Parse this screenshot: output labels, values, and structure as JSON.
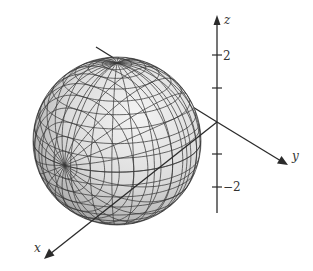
{
  "figure": {
    "axes": {
      "x": {
        "label": "x"
      },
      "y": {
        "label": "y"
      },
      "z": {
        "label": "z"
      }
    },
    "z_ticks": [
      {
        "value": 2,
        "label": "2"
      },
      {
        "value": 1,
        "label": ""
      },
      {
        "value": -1,
        "label": ""
      },
      {
        "value": -2,
        "label": "−2"
      }
    ],
    "colors": {
      "axis": "#2b2b2b",
      "grid": "#3a3a3a",
      "sphere_light": "#ededed",
      "sphere_dark": "#8a8a8a"
    }
  }
}
